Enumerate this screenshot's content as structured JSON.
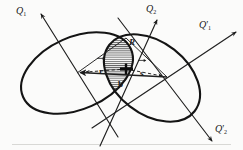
{
  "figure": {
    "caption": "",
    "background_color": "#fbfbfa",
    "line_color": "#1a1a1a",
    "hatch_color": "#3a3a3a"
  },
  "axes": [
    {
      "id": "q1",
      "label": "Q",
      "subscript": "1",
      "prime": "",
      "label_x": 16,
      "label_y": 8,
      "direction": "up-left",
      "line": {
        "x1": 118,
        "y1": 137,
        "x2": 41,
        "y2": 14
      },
      "arrow_at": "end"
    },
    {
      "id": "q2",
      "label": "Q",
      "subscript": "2",
      "prime": "",
      "label_x": 146,
      "label_y": 6,
      "direction": "up-right",
      "line": {
        "x1": 100,
        "y1": 146,
        "x2": 157,
        "y2": 20
      },
      "arrow_at": "end"
    },
    {
      "id": "q1p",
      "label": "Q",
      "subscript": "1",
      "prime": "′",
      "label_x": 200,
      "label_y": 22,
      "direction": "up-right",
      "line": {
        "x1": 92,
        "y1": 128,
        "x2": 236,
        "y2": 32
      },
      "arrow_at": "end"
    },
    {
      "id": "q2p",
      "label": "Q",
      "subscript": "2",
      "prime": "′",
      "label_x": 216,
      "label_y": 126,
      "direction": "down-right",
      "line": {
        "x1": 118,
        "y1": 18,
        "x2": 212,
        "y2": 141
      },
      "arrow_at": "end"
    }
  ],
  "ellipses": [
    {
      "id": "left-ellipse",
      "cx": 77,
      "cy": 73,
      "rx": 59,
      "ry": 36,
      "rotation_deg": -24
    },
    {
      "id": "right-ellipse",
      "cx": 152,
      "cy": 78,
      "rx": 54,
      "ry": 36,
      "rotation_deg": 38
    }
  ],
  "overlap_region": {
    "id": "hatched-overlap",
    "label": "R",
    "label_x": 130,
    "label_y": 44,
    "hatch_spacing": 2,
    "hatch_angle_deg": 0
  },
  "vectors": [
    {
      "id": "r-vector",
      "label": "r",
      "bold": true,
      "overbar_arrow": true,
      "label_x": 100,
      "label_y": 62,
      "style": "dashed",
      "from": {
        "x": 126,
        "y": 69
      },
      "to": {
        "x": 78,
        "y": 73
      },
      "arrow_at": "end"
    },
    {
      "id": "s-vector",
      "label": "s",
      "bold": true,
      "overbar_arrow": true,
      "label_x": 140,
      "label_y": 64,
      "style": "dashed",
      "from": {
        "x": 126,
        "y": 69
      },
      "to": {
        "x": 167,
        "y": 77
      },
      "arrow_at": "end"
    },
    {
      "id": "b-vector",
      "label": "b",
      "bold": true,
      "overbar_arrow": false,
      "label_x": 119,
      "label_y": 84,
      "style": "solid",
      "from": {
        "x": 167,
        "y": 77
      },
      "to": {
        "x": 77,
        "y": 73
      },
      "arrow_at": "end"
    }
  ],
  "intersection_point": {
    "x": 126,
    "y": 69,
    "marker": "bold-dot"
  },
  "triangle": {
    "id": "vector-triangle",
    "vertices": [
      {
        "x": 77,
        "y": 73
      },
      {
        "x": 126,
        "y": 69
      },
      {
        "x": 167,
        "y": 77
      }
    ]
  },
  "baseline": {
    "y": 144,
    "x1": 12,
    "x2": 231
  }
}
